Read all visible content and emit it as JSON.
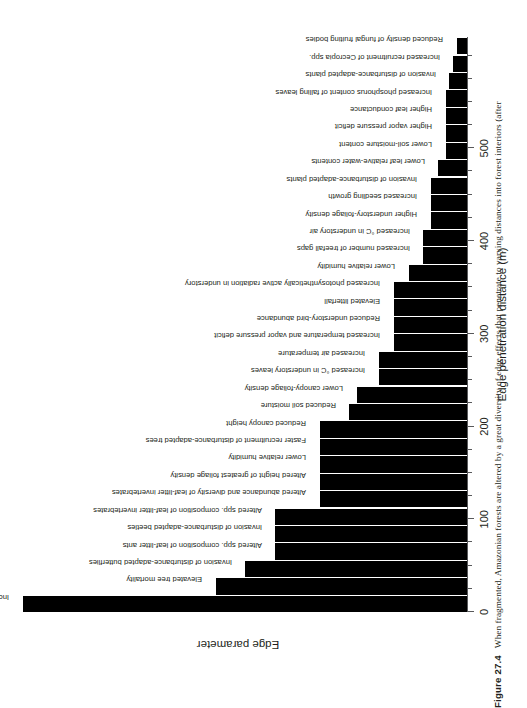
{
  "figure": {
    "number": "Figure 27.4",
    "caption": "When fragmented, Amazonian forests are altered by a great diversity of edge effects that penetrate to varying distances into forest interiors (after"
  },
  "chart_data": {
    "type": "bar",
    "orientation": "vertical-bars-rotated",
    "title": "",
    "xlabel": "Edge parameter",
    "ylabel": "Edge penetration distance (m)",
    "ylim": [
      0,
      620
    ],
    "grid": false,
    "legend": "none",
    "axis": {
      "major_ticks": [
        0,
        100,
        200,
        300,
        400,
        500
      ],
      "major_tick_labels": [
        "0",
        "100",
        "200",
        "300",
        "400",
        "500"
      ],
      "minor_tick_step": 25
    },
    "categories": [
      "Increased wind disturbance",
      "Elevated tree mortality",
      "Invasion of disturbance-adapted butterflies",
      "Altered spp. composition of leaf-litter ants",
      "Invasion of disturbance-adapted beetles",
      "Altered spp. composition of leaf-litter invertebrates",
      "Altered abundance and diversity of leaf-litter invertebrates",
      "Altered height of greatest foliage density",
      "Lower relative humidity",
      "Faster recruitment of disturbance-adapted trees",
      "Reduced canopy height",
      "Reduced soil moisture",
      "Lower canopy-foliage density",
      "Increased °C in understory leaves",
      "Increased air temperature",
      "Increased temperature and vapor pressure deficit",
      "Reduced understory-bird abundance",
      "Elevated litterfall",
      "Increased photosynthetically active radiation in understory",
      "Lower relative humidity",
      "Increased number of treefall gaps",
      "Increased °C in understory air",
      "Higher understory-foliage density",
      "Increased seedling growth",
      "Invasion of disturbance-adapted plants",
      "Lower leaf relative-water contents",
      "Lower soil-moisture content",
      "Higher vapor pressure deficit",
      "Higher leaf conductance",
      "Increased phosphorus content of falling leaves",
      "Invasion of disturbance-adapted plants",
      "Increased recruitment of Cecropia spp.",
      "Reduced density of fungal fruiting bodies"
    ],
    "values": [
      600,
      340,
      300,
      260,
      260,
      260,
      200,
      200,
      200,
      200,
      200,
      160,
      150,
      120,
      120,
      100,
      100,
      100,
      100,
      80,
      60,
      60,
      50,
      50,
      50,
      40,
      30,
      30,
      30,
      30,
      25,
      20,
      15
    ]
  }
}
